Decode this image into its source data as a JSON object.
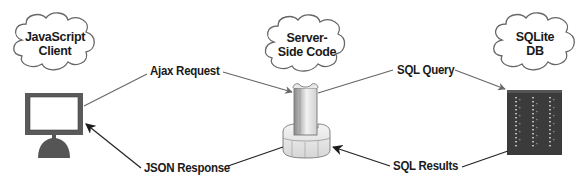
{
  "diagram": {
    "type": "client-server-database flow",
    "nodes": [
      {
        "id": "client",
        "cloud_label_lines": [
          "JavaScript",
          "Client"
        ],
        "icon": "monitor-icon"
      },
      {
        "id": "server",
        "cloud_label_lines": [
          "Server-",
          "Side Code"
        ],
        "icon": "server-column-icon"
      },
      {
        "id": "db",
        "cloud_label_lines": [
          "SQLite",
          "DB"
        ],
        "icon": "database-rack-icon"
      }
    ],
    "edges": [
      {
        "id": "ajax",
        "label": "Ajax Request",
        "from": "client",
        "to": "server"
      },
      {
        "id": "json",
        "label": "JSON Response",
        "from": "server",
        "to": "client"
      },
      {
        "id": "query",
        "label": "SQL Query",
        "from": "server",
        "to": "db"
      },
      {
        "id": "results",
        "label": "SQL Results",
        "from": "db",
        "to": "server"
      }
    ],
    "colors": {
      "line": "#555555",
      "arrow_dark": "#222222",
      "monitor_frame": "#5a5a5a",
      "db_body": "#3b3b3b",
      "cloud_stroke": "#666666"
    }
  }
}
